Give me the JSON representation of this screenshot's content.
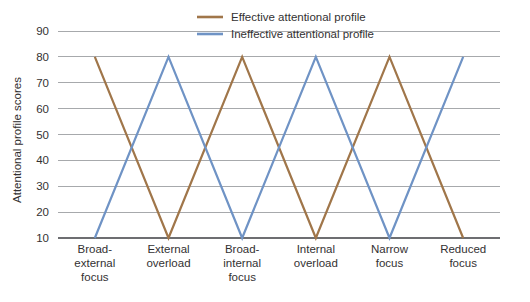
{
  "chart_data": {
    "type": "line",
    "title": "",
    "subtitle": "",
    "xlabel": "",
    "ylabel": "Attentional profile scores",
    "ylim": [
      10,
      90
    ],
    "ytick_values": [
      90,
      80,
      70,
      60,
      50,
      40,
      30,
      20,
      10
    ],
    "ytick_labels": [
      "90",
      "80",
      "70",
      "60",
      "50",
      "40",
      "30",
      "20",
      "10"
    ],
    "grid": true,
    "legend_position": "top-center",
    "categories": [
      "Broad-external focus",
      "External overload",
      "Broad-internal focus",
      "Internal overload",
      "Narrow focus",
      "Reduced focus"
    ],
    "category_lines": [
      [
        "Broad-",
        "external",
        "focus"
      ],
      [
        "External",
        "overload"
      ],
      [
        "Broad-",
        "internal",
        "focus"
      ],
      [
        "Internal",
        "overload"
      ],
      [
        "Narrow",
        "focus"
      ],
      [
        "Reduced",
        "focus"
      ]
    ],
    "series": [
      {
        "name": "Effective attentional profile",
        "color": "#a0764a",
        "values": [
          80,
          10,
          80,
          10,
          80,
          10
        ]
      },
      {
        "name": "Ineffective attentional profile",
        "color": "#6f93c5",
        "values": [
          10,
          80,
          10,
          80,
          10,
          80
        ]
      }
    ]
  },
  "legend": {
    "items": [
      {
        "label": "Effective attentional profile",
        "color": "#a0764a"
      },
      {
        "label": "Ineffective attentional profile",
        "color": "#6f93c5"
      }
    ]
  },
  "colors": {
    "effective": "#a0764a",
    "ineffective": "#6f93c5",
    "gridline": "#a7a9ac",
    "axis": "#6d6e71",
    "text": "#333132",
    "background": "#ffffff"
  }
}
